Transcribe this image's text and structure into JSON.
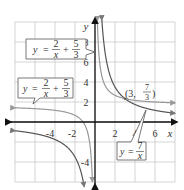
{
  "chart_data": {
    "type": "line",
    "title": "",
    "xlabel": "x",
    "ylabel": "y",
    "xlim": [
      -8,
      8
    ],
    "ylim": [
      -6,
      10
    ],
    "grid": true,
    "grid_step": 2,
    "x_ticks": [
      "-4",
      "-2",
      "2",
      "4",
      "6"
    ],
    "y_ticks": [
      "8",
      "6",
      "4",
      "2",
      "-4"
    ],
    "series": [
      {
        "name": "y = 7/x",
        "equation": "7/x",
        "asymptote_y": 0,
        "color": "#555555"
      },
      {
        "name": "y = 2/x + 5/3",
        "equation": "2/x + 5/3",
        "asymptote_y": 1.6667,
        "color": "#888888"
      }
    ],
    "annotations": [
      {
        "point": "(3, 7/3)",
        "x": 3,
        "y": 2.3333
      }
    ],
    "labels": {
      "transformed_top": {
        "y": "y",
        "eq": "=",
        "num1": "2",
        "den1": "x",
        "plus": "+",
        "num2": "5",
        "den2": "3"
      },
      "transformed_left": {
        "y": "y",
        "eq": "=",
        "num1": "2",
        "den1": "x",
        "plus": "+",
        "num2": "5",
        "den2": "3"
      },
      "parent": {
        "y": "y",
        "eq": "=",
        "num": "7",
        "den": "x"
      },
      "point": {
        "open": "(3,",
        "num": "7",
        "den": "3",
        "close": ")"
      }
    }
  }
}
